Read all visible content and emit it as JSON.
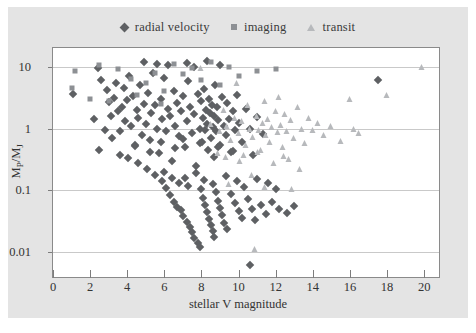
{
  "figure": {
    "background": "#e4e4e4",
    "plot_background": "#ffffff",
    "frame_color": "#8a8a8a"
  },
  "legend": {
    "position": "top-center",
    "items": [
      {
        "label": "radial velocity",
        "marker": "diamond-icon",
        "color": "#5e6063"
      },
      {
        "label": "imaging",
        "marker": "square-icon",
        "color": "#8d9094"
      },
      {
        "label": "transit",
        "marker": "triangle-icon",
        "color": "#b7b9bc"
      }
    ]
  },
  "axes": {
    "xlabel": "stellar V magnitude",
    "ylabel_main": "M",
    "ylabel_sub1": "P",
    "ylabel_slash": "/M",
    "ylabel_sub2": "J",
    "xticks": [
      "0",
      "2",
      "4",
      "6",
      "8",
      "10",
      "12",
      "14",
      "16",
      "18",
      "20"
    ],
    "yticks": [
      "10",
      "1",
      "0.1",
      "0.01"
    ]
  },
  "chart_data": {
    "type": "scatter",
    "title": "",
    "xlabel": "stellar V magnitude",
    "ylabel": "M_P/M_J",
    "xlim": [
      0,
      20.8
    ],
    "ylim": [
      0.004,
      20
    ],
    "yscale": "log",
    "xscale": "linear",
    "grid": "horizontal",
    "legend_position": "top-center",
    "series": [
      {
        "name": "radial velocity",
        "marker": "diamond",
        "color": "#5e6063",
        "points": [
          [
            1.1,
            3.6
          ],
          [
            2.4,
            9.5
          ],
          [
            2.6,
            6.0
          ],
          [
            2.9,
            4.2
          ],
          [
            3.0,
            2.7
          ],
          [
            3.1,
            1.6
          ],
          [
            3.3,
            3.1
          ],
          [
            3.4,
            5.5
          ],
          [
            3.5,
            1.9
          ],
          [
            3.6,
            0.9
          ],
          [
            3.7,
            2.2
          ],
          [
            3.8,
            4.6
          ],
          [
            3.9,
            1.3
          ],
          [
            4.0,
            2.9
          ],
          [
            4.1,
            7.0
          ],
          [
            4.2,
            1.1
          ],
          [
            4.3,
            3.4
          ],
          [
            4.4,
            0.55
          ],
          [
            4.5,
            2.0
          ],
          [
            4.6,
            1.5
          ],
          [
            4.7,
            5.0
          ],
          [
            4.8,
            0.8
          ],
          [
            4.9,
            2.5
          ],
          [
            5.0,
            1.2
          ],
          [
            5.1,
            3.8
          ],
          [
            5.2,
            0.65
          ],
          [
            5.3,
            1.8
          ],
          [
            5.4,
            8.0
          ],
          [
            5.5,
            2.4
          ],
          [
            5.6,
            1.0
          ],
          [
            5.7,
            0.4
          ],
          [
            5.8,
            3.0
          ],
          [
            5.9,
            1.4
          ],
          [
            6.0,
            6.5
          ],
          [
            6.1,
            0.9
          ],
          [
            6.2,
            2.1
          ],
          [
            6.3,
            1.6
          ],
          [
            6.4,
            0.3
          ],
          [
            6.5,
            4.0
          ],
          [
            6.6,
            1.1
          ],
          [
            6.7,
            2.6
          ],
          [
            6.8,
            0.75
          ],
          [
            6.9,
            1.9
          ],
          [
            7.0,
            3.3
          ],
          [
            7.1,
            0.5
          ],
          [
            7.2,
            1.3
          ],
          [
            7.3,
            5.8
          ],
          [
            7.4,
            2.2
          ],
          [
            7.5,
            0.85
          ],
          [
            7.6,
            1.7
          ],
          [
            7.7,
            0.25
          ],
          [
            7.8,
            3.6
          ],
          [
            7.9,
            1.0
          ],
          [
            8.0,
            2.8
          ],
          [
            8.05,
            0.6
          ],
          [
            8.1,
            1.5
          ],
          [
            8.15,
            4.4
          ],
          [
            8.2,
            0.95
          ],
          [
            8.25,
            2.0
          ],
          [
            8.3,
            1.2
          ],
          [
            8.35,
            0.45
          ],
          [
            8.4,
            3.0
          ],
          [
            8.45,
            1.8
          ],
          [
            8.5,
            0.7
          ],
          [
            8.55,
            2.4
          ],
          [
            8.6,
            1.05
          ],
          [
            8.65,
            0.35
          ],
          [
            8.7,
            1.6
          ],
          [
            8.75,
            5.0
          ],
          [
            8.8,
            0.9
          ],
          [
            8.85,
            2.2
          ],
          [
            8.9,
            1.35
          ],
          [
            9.0,
            0.55
          ],
          [
            9.1,
            3.2
          ],
          [
            9.2,
            1.1
          ],
          [
            9.3,
            0.8
          ],
          [
            9.4,
            2.6
          ],
          [
            9.5,
            1.45
          ],
          [
            9.6,
            0.42
          ],
          [
            9.7,
            1.9
          ],
          [
            9.8,
            0.95
          ],
          [
            9.9,
            3.5
          ],
          [
            10.0,
            1.25
          ],
          [
            10.2,
            0.6
          ],
          [
            10.4,
            2.1
          ],
          [
            10.6,
            1.0
          ],
          [
            10.8,
            0.38
          ],
          [
            11.0,
            1.55
          ],
          [
            11.3,
            0.82
          ],
          [
            2.2,
            1.4
          ],
          [
            2.8,
            0.95
          ],
          [
            3.2,
            0.7
          ],
          [
            4.05,
            0.33
          ],
          [
            4.6,
            0.28
          ],
          [
            5.05,
            0.22
          ],
          [
            5.5,
            0.18
          ],
          [
            5.9,
            0.14
          ],
          [
            6.1,
            0.11
          ],
          [
            6.3,
            0.085
          ],
          [
            6.5,
            0.065
          ],
          [
            6.7,
            0.055
          ],
          [
            6.9,
            0.048
          ],
          [
            7.0,
            0.038
          ],
          [
            7.2,
            0.031
          ],
          [
            7.4,
            0.026
          ],
          [
            7.5,
            0.021
          ],
          [
            7.6,
            0.017
          ],
          [
            7.8,
            0.014
          ],
          [
            7.9,
            0.012
          ],
          [
            8.0,
            0.105
          ],
          [
            8.1,
            0.075
          ],
          [
            8.2,
            0.058
          ],
          [
            8.3,
            0.045
          ],
          [
            8.4,
            0.035
          ],
          [
            8.5,
            0.028
          ],
          [
            8.6,
            0.022
          ],
          [
            8.7,
            0.018
          ],
          [
            8.8,
            0.095
          ],
          [
            8.9,
            0.068
          ],
          [
            9.0,
            0.052
          ],
          [
            9.1,
            0.04
          ],
          [
            9.2,
            0.03
          ],
          [
            9.4,
            0.024
          ],
          [
            9.6,
            0.088
          ],
          [
            9.8,
            0.062
          ],
          [
            10.0,
            0.047
          ],
          [
            10.2,
            0.036
          ],
          [
            10.5,
            0.072
          ],
          [
            10.7,
            0.05
          ],
          [
            10.9,
            0.033
          ],
          [
            11.2,
            0.058
          ],
          [
            11.5,
            0.042
          ],
          [
            11.8,
            0.065
          ],
          [
            12.2,
            0.051
          ],
          [
            12.6,
            0.044
          ],
          [
            13.0,
            0.056
          ],
          [
            10.6,
            0.0062
          ],
          [
            17.5,
            6.0
          ],
          [
            6.0,
            0.2
          ],
          [
            6.4,
            0.16
          ],
          [
            6.8,
            0.13
          ],
          [
            7.1,
            0.16
          ],
          [
            7.3,
            0.12
          ],
          [
            7.7,
            0.19
          ],
          [
            8.15,
            0.15
          ],
          [
            8.6,
            0.125
          ],
          [
            9.3,
            0.17
          ],
          [
            9.9,
            0.14
          ],
          [
            10.3,
            0.115
          ],
          [
            11.0,
            0.155
          ],
          [
            11.6,
            0.13
          ],
          [
            12.0,
            0.105
          ],
          [
            2.5,
            0.45
          ],
          [
            3.6,
            0.38
          ],
          [
            4.4,
            0.52
          ],
          [
            5.2,
            0.42
          ],
          [
            5.8,
            0.6
          ],
          [
            6.6,
            0.48
          ],
          [
            7.0,
            0.68
          ],
          [
            7.9,
            0.58
          ],
          [
            8.9,
            0.5
          ],
          [
            9.7,
            0.44
          ],
          [
            4.9,
            12.0
          ],
          [
            5.6,
            11.0
          ],
          [
            6.2,
            10.5
          ],
          [
            7.2,
            11.5
          ],
          [
            7.6,
            10.0
          ],
          [
            8.3,
            12.5
          ],
          [
            9.0,
            10.8
          ]
        ]
      },
      {
        "name": "imaging",
        "marker": "square",
        "color": "#8d9094",
        "points": [
          [
            1.0,
            4.5
          ],
          [
            1.2,
            8.5
          ],
          [
            2.0,
            3.0
          ],
          [
            3.0,
            2.8
          ],
          [
            3.5,
            9.0
          ],
          [
            4.2,
            6.2
          ],
          [
            4.5,
            3.5
          ],
          [
            5.0,
            5.5
          ],
          [
            5.5,
            8.0
          ],
          [
            6.0,
            4.0
          ],
          [
            6.5,
            11.0
          ],
          [
            7.0,
            7.5
          ],
          [
            7.5,
            9.5
          ],
          [
            8.0,
            6.0
          ],
          [
            8.5,
            12.0
          ],
          [
            9.0,
            5.0
          ],
          [
            9.5,
            10.0
          ],
          [
            10.0,
            7.0
          ],
          [
            11.0,
            8.5
          ],
          [
            12.0,
            9.0
          ],
          [
            2.5,
            10.5
          ],
          [
            5.8,
            2.5
          ]
        ]
      },
      {
        "name": "transit",
        "marker": "triangle",
        "color": "#b7b9bc",
        "points": [
          [
            8.0,
            9.5
          ],
          [
            8.5,
            1.2
          ],
          [
            9.0,
            0.9
          ],
          [
            9.2,
            2.0
          ],
          [
            9.4,
            1.1
          ],
          [
            9.6,
            0.65
          ],
          [
            9.8,
            1.5
          ],
          [
            10.0,
            0.85
          ],
          [
            10.2,
            1.3
          ],
          [
            10.4,
            0.55
          ],
          [
            10.5,
            2.4
          ],
          [
            10.6,
            1.0
          ],
          [
            10.8,
            0.72
          ],
          [
            11.0,
            1.6
          ],
          [
            11.1,
            0.95
          ],
          [
            11.2,
            0.45
          ],
          [
            11.3,
            1.25
          ],
          [
            11.4,
            2.8
          ],
          [
            11.5,
            0.8
          ],
          [
            11.6,
            1.45
          ],
          [
            11.7,
            0.6
          ],
          [
            11.8,
            1.05
          ],
          [
            12.0,
            1.9
          ],
          [
            12.1,
            0.88
          ],
          [
            12.2,
            3.2
          ],
          [
            12.3,
            1.15
          ],
          [
            12.4,
            0.5
          ],
          [
            12.5,
            1.7
          ],
          [
            12.6,
            0.92
          ],
          [
            12.8,
            1.35
          ],
          [
            13.0,
            0.7
          ],
          [
            13.2,
            2.2
          ],
          [
            13.4,
            1.0
          ],
          [
            13.6,
            0.58
          ],
          [
            13.8,
            1.5
          ],
          [
            14.0,
            0.95
          ],
          [
            14.3,
            1.25
          ],
          [
            14.6,
            0.8
          ],
          [
            15.0,
            1.1
          ],
          [
            15.5,
            0.62
          ],
          [
            16.0,
            3.0
          ],
          [
            16.2,
            1.0
          ],
          [
            16.5,
            0.85
          ],
          [
            19.9,
            10.0
          ],
          [
            18.0,
            3.5
          ],
          [
            9.9,
            5.5
          ],
          [
            10.1,
            0.3
          ],
          [
            11.9,
            0.28
          ],
          [
            12.7,
            0.32
          ],
          [
            13.3,
            0.22
          ],
          [
            10.7,
            0.18
          ],
          [
            11.4,
            0.115
          ],
          [
            9.5,
            0.125
          ],
          [
            12.9,
            0.105
          ],
          [
            10.9,
            0.0115
          ],
          [
            8.9,
            0.4
          ],
          [
            9.3,
            0.35
          ],
          [
            10.3,
            0.38
          ],
          [
            11.05,
            0.42
          ],
          [
            12.45,
            0.36
          ]
        ]
      }
    ]
  }
}
